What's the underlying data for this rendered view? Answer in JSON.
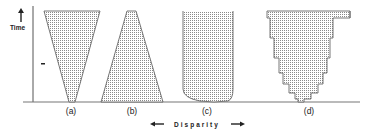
{
  "axes": {
    "y_label": "Time",
    "x_label": "Disparity"
  },
  "panels": [
    {
      "id": "a",
      "label": "(a)",
      "shape": "inverted-triangle"
    },
    {
      "id": "b",
      "label": "(b)",
      "shape": "trapezoid"
    },
    {
      "id": "c",
      "label": "(c)",
      "shape": "rounded-bottom-rectangle"
    },
    {
      "id": "d",
      "label": "(d)",
      "shape": "stepped-funnel"
    }
  ],
  "colors": {
    "stroke": "#555555",
    "fill_dots": "#8a8a8a",
    "text": "#222222"
  }
}
